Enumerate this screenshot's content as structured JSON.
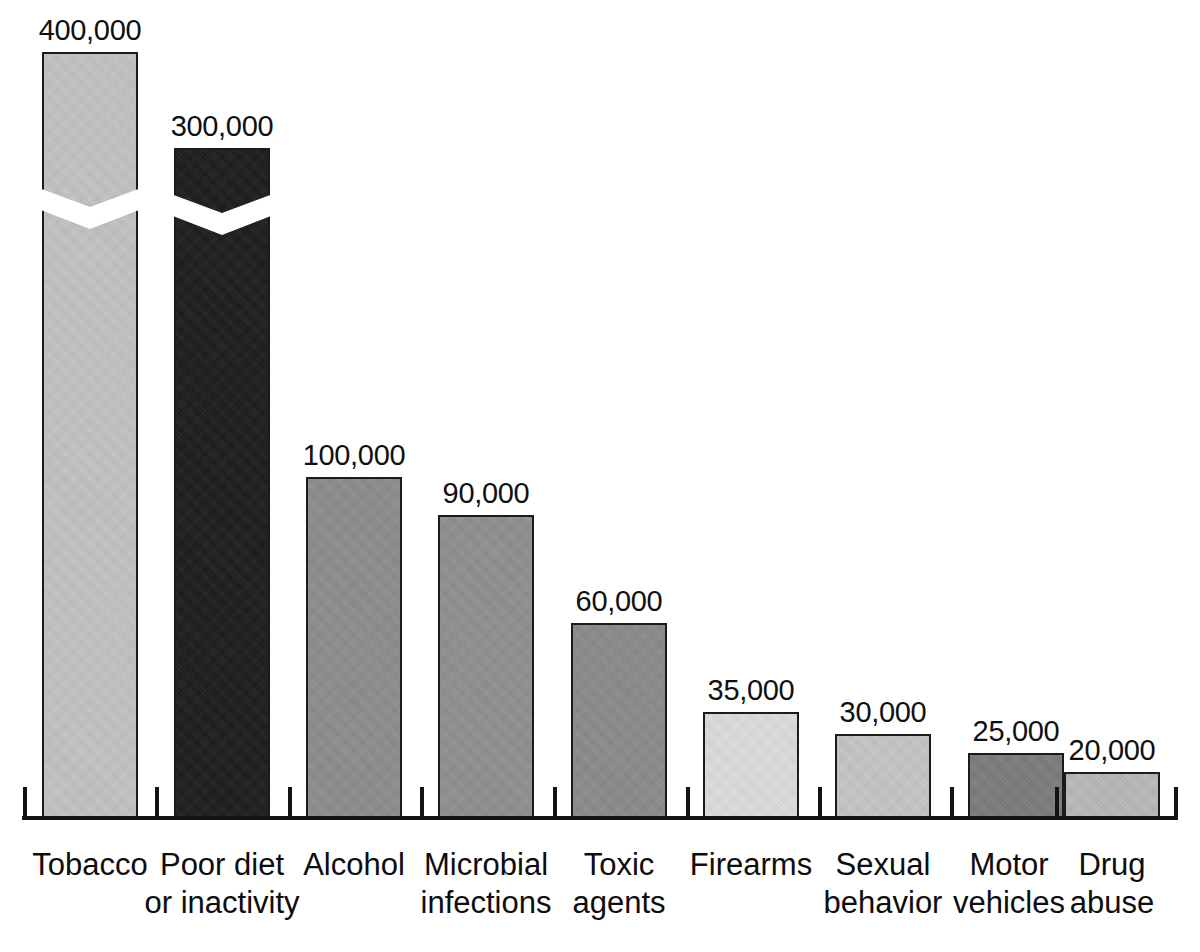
{
  "chart_data": {
    "type": "bar",
    "title": "",
    "subtitle": "",
    "xlabel": "",
    "ylabel": "",
    "ylim": [
      0,
      400000
    ],
    "grid": false,
    "legend": "none",
    "axis_break_note": "Bars for Tobacco and Poor diet or inactivity are drawn with a zigzag axis break indicating a truncated scale.",
    "categories": [
      "Tobacco",
      "Poor diet\nor inactivity",
      "Alcohol",
      "Microbial\ninfections",
      "Toxic\nagents",
      "Firearms",
      "Sexual\nbehavior",
      "Motor\nvehicles",
      "Drug\nabuse"
    ],
    "values": [
      400000,
      300000,
      100000,
      90000,
      60000,
      35000,
      30000,
      25000,
      20000
    ],
    "value_labels": [
      "400,000",
      "300,000",
      "100,000",
      "90,000",
      "60,000",
      "35,000",
      "30,000",
      "25,000",
      "20,000"
    ],
    "bar_colors": [
      "#c3c3c3",
      "#191919",
      "#8c8c8c",
      "#8f8f8f",
      "#8a8a8a",
      "#dedede",
      "#c6c6c6",
      "#7b7b7b",
      "#b9b9b9"
    ],
    "bar_outline_color": "#1b1b1b",
    "axis_color": "#121212",
    "background_color": "#ffffff",
    "has_axis_break": [
      true,
      true,
      false,
      false,
      false,
      false,
      false,
      false,
      false
    ]
  },
  "geometry": {
    "baseline_y": 818,
    "bars": [
      {
        "x": 42,
        "width": 96,
        "top": 52,
        "break_top": 186
      },
      {
        "x": 174,
        "width": 96,
        "top": 148,
        "break_top": 192
      },
      {
        "x": 306,
        "width": 96,
        "top": 477,
        "break_top": null
      },
      {
        "x": 438,
        "width": 96,
        "top": 515,
        "break_top": null
      },
      {
        "x": 571,
        "width": 96,
        "top": 623,
        "break_top": null
      },
      {
        "x": 703,
        "width": 96,
        "top": 712,
        "break_top": null
      },
      {
        "x": 835,
        "width": 96,
        "top": 734,
        "break_top": null
      },
      {
        "x": 968,
        "width": 96,
        "top": 753,
        "break_top": null
      },
      {
        "x": 1064,
        "width": 96,
        "top": 772,
        "break_top": null
      }
    ],
    "ticks": [
      23,
      155,
      288,
      420,
      553,
      686,
      818,
      950,
      1055,
      1174
    ],
    "label_centers": [
      90,
      222,
      354,
      486,
      619,
      751,
      883,
      1009,
      1112
    ]
  }
}
